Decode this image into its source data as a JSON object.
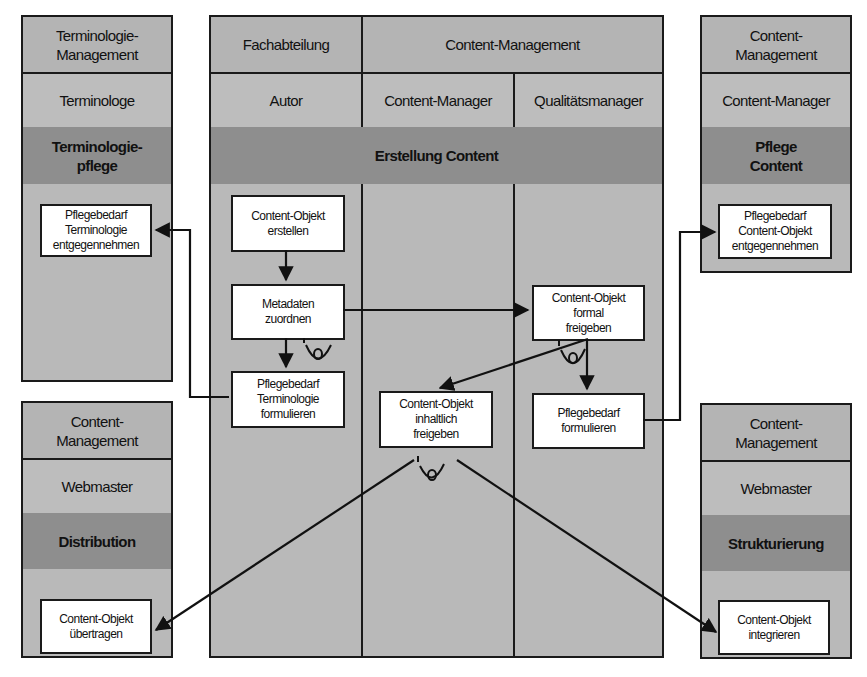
{
  "diagram": {
    "type": "swimlane-process",
    "center": {
      "departments": [
        "Fachabteilung",
        "Content-Management"
      ],
      "roles": [
        "Autor",
        "Content-Manager",
        "Qualitätsmanager"
      ],
      "process": "Erstellung Content",
      "activities": {
        "create": "Content-Objekt erstellen",
        "metadata": "Metadaten zuordnen",
        "term_need": "Pflegebedarf Terminologie formulieren",
        "content_release": "Content-Objekt inhaltlich freigeben",
        "formal_release": "Content-Objekt formal freigeben",
        "need": "Pflegebedarf formulieren"
      }
    },
    "left_top": {
      "department": "Terminologie-Management",
      "role": "Terminologe",
      "process": "Terminologie-pflege",
      "activity": "Pflegebedarf Terminologie entgegennehmen"
    },
    "right_top": {
      "department": "Content-Management",
      "role": "Content-Manager",
      "process": "Pflege Content",
      "activity": "Pflegebedarf Content-Objekt entgegennehmen"
    },
    "left_bottom": {
      "department": "Content-Management",
      "role": "Webmaster",
      "process": "Distribution",
      "activity": "Content-Objekt übertragen"
    },
    "right_bottom": {
      "department": "Content-Management",
      "role": "Webmaster",
      "process": "Strukturierung",
      "activity": "Content-Objekt integrieren"
    },
    "connector_symbol": "O"
  }
}
